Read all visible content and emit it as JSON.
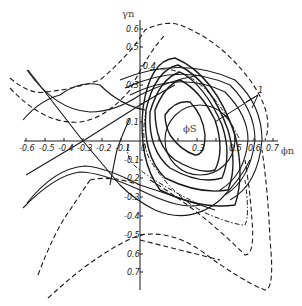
{
  "figure": {
    "x_axis": {
      "label": "ϕn",
      "ticks": [
        "-0.6",
        "-0.5",
        "-0.4",
        "-0.3",
        "-0.2",
        "-0.1",
        "0",
        "0.3",
        "0.5",
        "0.6",
        "0.7"
      ]
    },
    "y_axis": {
      "label": "γn",
      "ticks_positive": [
        "0.6",
        "0.5",
        "0.4",
        "0.3",
        "0.1"
      ],
      "ticks_negative": [
        "-0.1",
        "-0.2",
        "-0.3",
        "-0.4",
        "-0.5",
        "0.6",
        "0.7"
      ]
    },
    "annotations": {
      "fixed_point": "ϕS",
      "curve_marker": "1"
    }
  }
}
